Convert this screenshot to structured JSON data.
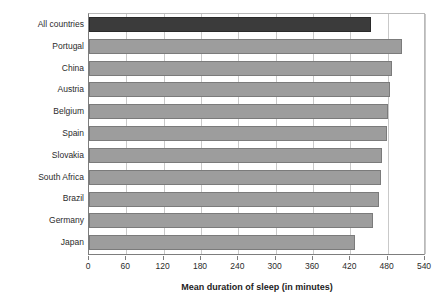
{
  "chart_data": {
    "type": "bar",
    "orientation": "horizontal",
    "title": "",
    "xlabel": "Mean duration of sleep (in minutes)",
    "ylabel": "",
    "xlim": [
      0,
      540
    ],
    "xticks": [
      0,
      60,
      120,
      180,
      240,
      300,
      360,
      420,
      480,
      540
    ],
    "xtick_labels": [
      "0",
      "60",
      "120",
      "180",
      "240",
      "300",
      "360",
      "420",
      "480",
      "540"
    ],
    "grid": true,
    "grid_axis": "x",
    "legend": null,
    "categories": [
      "All countries",
      "Portugal",
      "China",
      "Austria",
      "Belgium",
      "Spain",
      "Slovakia",
      "South Africa",
      "Brazil",
      "Germany",
      "Japan"
    ],
    "values": [
      453,
      503,
      487,
      484,
      481,
      479,
      471,
      469,
      466,
      457,
      428
    ],
    "highlight_index": 0,
    "colors": {
      "bar": "#9d9d9d",
      "bar_border": "#7b7b7b",
      "bar_highlight": "#3b3b3b",
      "bar_highlight_border": "#2a2a2a",
      "gridline": "#c9c9c9",
      "axis": "#7d7d7d",
      "text": "#2b2b2b",
      "background": "#ffffff"
    }
  }
}
